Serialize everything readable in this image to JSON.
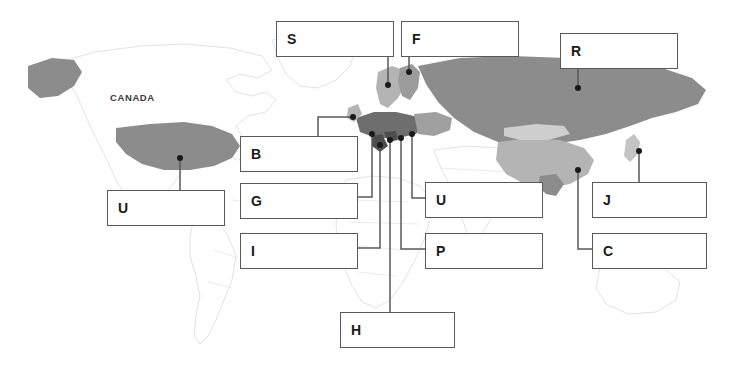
{
  "figure": {
    "type": "world-map-worksheet",
    "background_color": "#ffffff",
    "box_border_color": "#58595b",
    "leader_color": "#58595b",
    "dot_color": "#1a1a1a",
    "region_fill_dark": "#8c8c8c",
    "region_fill_light": "#b4b4b4",
    "region_fill_lightest": "#cfcfcf",
    "country_outline_color": "#d5d5d5"
  },
  "map_labels": [
    {
      "id": "canada",
      "text": "CANADA",
      "x": 110,
      "y": 92
    }
  ],
  "callouts": [
    {
      "id": "s",
      "letter": "S",
      "text": "",
      "box": {
        "x": 276,
        "y": 21,
        "w": 118,
        "h": 36
      },
      "dot": {
        "x": 388,
        "y": 85
      },
      "path": "M 388 57 L 388 85"
    },
    {
      "id": "f",
      "letter": "F",
      "text": "",
      "box": {
        "x": 401,
        "y": 21,
        "w": 118,
        "h": 36
      },
      "dot": {
        "x": 409,
        "y": 72
      },
      "path": "M 409 57 L 409 72"
    },
    {
      "id": "r",
      "letter": "R",
      "text": "",
      "box": {
        "x": 560,
        "y": 33,
        "w": 118,
        "h": 36
      },
      "dot": {
        "x": 578,
        "y": 88
      },
      "path": "M 578 69 L 578 88"
    },
    {
      "id": "b",
      "letter": "B",
      "text": "",
      "box": {
        "x": 240,
        "y": 136,
        "w": 118,
        "h": 36
      },
      "dot": {
        "x": 353,
        "y": 117
      },
      "path": "M 318 136 L 318 117 L 353 117"
    },
    {
      "id": "u_usa",
      "letter": "U",
      "text": "",
      "box": {
        "x": 107,
        "y": 190,
        "w": 118,
        "h": 36
      },
      "dot": {
        "x": 180,
        "y": 158
      },
      "path": "M 180 190 L 180 158"
    },
    {
      "id": "g",
      "letter": "G",
      "text": "",
      "box": {
        "x": 240,
        "y": 183,
        "w": 118,
        "h": 36
      },
      "dot": {
        "x": 372,
        "y": 134
      },
      "path": "M 358 197 L 372 197 L 372 134"
    },
    {
      "id": "i",
      "letter": "I",
      "text": "",
      "box": {
        "x": 240,
        "y": 233,
        "w": 118,
        "h": 36
      },
      "dot": {
        "x": 380,
        "y": 145
      },
      "path": "M 358 248 L 380 248 L 380 145"
    },
    {
      "id": "u_mid",
      "letter": "U",
      "text": "",
      "box": {
        "x": 425,
        "y": 182,
        "w": 118,
        "h": 36
      },
      "dot": {
        "x": 412,
        "y": 134
      },
      "path": "M 425 198 L 412 198 L 412 134"
    },
    {
      "id": "p",
      "letter": "P",
      "text": "",
      "box": {
        "x": 425,
        "y": 233,
        "w": 118,
        "h": 36
      },
      "dot": {
        "x": 401,
        "y": 138
      },
      "path": "M 425 249 L 401 249 L 401 138"
    },
    {
      "id": "j",
      "letter": "J",
      "text": "",
      "box": {
        "x": 592,
        "y": 182,
        "w": 115,
        "h": 36
      },
      "dot": {
        "x": 639,
        "y": 151
      },
      "path": "M 639 182 L 639 151"
    },
    {
      "id": "c",
      "letter": "C",
      "text": "",
      "box": {
        "x": 592,
        "y": 233,
        "w": 115,
        "h": 36
      },
      "dot": {
        "x": 578,
        "y": 170
      },
      "path": "M 592 249 L 578 249 L 578 170"
    },
    {
      "id": "h",
      "letter": "H",
      "text": "",
      "box": {
        "x": 340,
        "y": 312,
        "w": 115,
        "h": 36
      },
      "dot": {
        "x": 390,
        "y": 140
      },
      "path": "M 390 312 L 390 140"
    }
  ]
}
